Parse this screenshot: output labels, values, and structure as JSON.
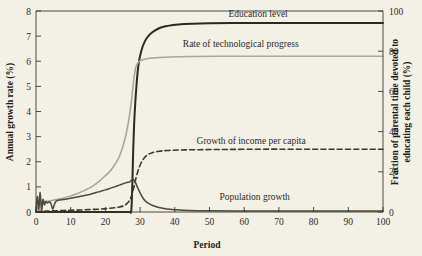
{
  "chart_data": {
    "type": "line",
    "title": "",
    "xlabel": "Period",
    "ylabel": "Annual growth rate (%)",
    "y2label": "Fraction of parental time devoted to educating each child (%)",
    "xlim": [
      0,
      100
    ],
    "ylim": [
      0,
      8
    ],
    "y2lim": [
      0,
      100
    ],
    "xticks": [
      0,
      10,
      20,
      30,
      40,
      50,
      60,
      70,
      80,
      90,
      100
    ],
    "xtick_labels": [
      "0",
      "10",
      "20",
      "30",
      "40",
      "50",
      "60",
      "70",
      "80",
      "90",
      "100"
    ],
    "yticks": [
      0,
      1,
      2,
      3,
      4,
      5,
      6,
      7,
      8
    ],
    "ytick_labels": [
      "0",
      "1",
      "2",
      "3",
      "4",
      "5",
      "6",
      "7",
      "8"
    ],
    "y2ticks": [
      0,
      20,
      40,
      60,
      80,
      100
    ],
    "y2tick_labels": [
      "0",
      "20",
      "40",
      "60",
      "80",
      "100"
    ],
    "grid": false,
    "legend_position": "inline-annotations",
    "series": [
      {
        "name": "Education level",
        "label": "Education level",
        "axis": "right",
        "color": "#2b2924",
        "style": "solid",
        "width": 2.0,
        "label_x": 64,
        "label_y_value": 97,
        "x": [
          0,
          5,
          10,
          15,
          20,
          24,
          26,
          27,
          27.4,
          27.6,
          27.8,
          28,
          28.4,
          29,
          29.6,
          30.4,
          31.4,
          32.6,
          34,
          36,
          38,
          41,
          45,
          50,
          60,
          70,
          80,
          90,
          100
        ],
        "y": [
          0,
          0,
          0,
          0,
          0,
          0,
          0,
          0,
          0,
          5,
          16,
          30,
          48,
          64,
          74,
          80.5,
          85,
          88,
          90,
          91.8,
          92.6,
          93.3,
          93.7,
          93.9,
          94,
          94,
          94,
          94,
          94
        ]
      },
      {
        "name": "Rate of technological progress",
        "label": "Rate of technological progress",
        "axis": "left",
        "color": "#a8a698",
        "style": "solid",
        "width": 1.6,
        "label_x": 59,
        "label_y_value": 6.55,
        "x": [
          0,
          0.6,
          1.2,
          2,
          3,
          4,
          5,
          6,
          8,
          10,
          12,
          14,
          16,
          18,
          20,
          21.5,
          23,
          24,
          25,
          25.8,
          26.4,
          27,
          27.4,
          27.8,
          28.2,
          28.8,
          29.6,
          30.6,
          32,
          34,
          37,
          41,
          46,
          52,
          60,
          70,
          80,
          90,
          100
        ],
        "y": [
          0.06,
          0.18,
          0.3,
          0.38,
          0.42,
          0.45,
          0.47,
          0.5,
          0.56,
          0.64,
          0.74,
          0.86,
          1.0,
          1.2,
          1.45,
          1.65,
          1.95,
          2.2,
          2.6,
          3.0,
          3.4,
          3.9,
          4.3,
          4.8,
          5.3,
          5.78,
          5.98,
          6.05,
          6.1,
          6.13,
          6.16,
          6.18,
          6.19,
          6.2,
          6.2,
          6.2,
          6.2,
          6.2,
          6.2
        ]
      },
      {
        "name": "Growth of income per capita",
        "label": "Growth of income per capita",
        "axis": "left",
        "color": "#3a3833",
        "style": "dashed",
        "width": 1.6,
        "label_x": 62,
        "label_y_value": 2.72,
        "x": [
          0,
          2,
          4,
          6,
          8,
          10,
          13,
          16,
          19,
          22,
          24,
          25.5,
          26.5,
          27.2,
          27.8,
          28.4,
          29,
          29.8,
          30.8,
          32,
          33.5,
          35.5,
          38,
          42,
          47,
          55,
          65,
          75,
          85,
          95,
          100
        ],
        "y": [
          0.02,
          0.03,
          0.04,
          0.05,
          0.06,
          0.07,
          0.08,
          0.1,
          0.12,
          0.16,
          0.2,
          0.26,
          0.38,
          0.52,
          0.78,
          1.1,
          1.45,
          1.8,
          2.08,
          2.26,
          2.36,
          2.42,
          2.45,
          2.47,
          2.48,
          2.49,
          2.5,
          2.5,
          2.5,
          2.5,
          2.5
        ]
      },
      {
        "name": "Population growth",
        "label": "Population growth",
        "axis": "left",
        "color": "#4a4840",
        "style": "solid",
        "width": 1.5,
        "label_x": 63,
        "label_y_value": 0.47,
        "x": [
          0,
          0.4,
          0.8,
          1.2,
          1.6,
          2.0,
          2.4,
          2.8,
          3.2,
          3.6,
          4.0,
          4.4,
          4.8,
          5.2,
          5.6,
          6.2,
          7,
          8,
          9,
          10,
          12,
          14,
          16,
          18,
          20,
          21.5,
          23,
          24,
          25,
          25.8,
          26.4,
          27,
          27.4,
          27.8,
          28.2,
          28.6,
          29.2,
          30,
          31,
          32.2,
          33.6,
          35.4,
          37.6,
          40,
          44,
          50,
          58,
          68,
          80,
          90,
          100
        ],
        "y": [
          0.02,
          0.62,
          0.1,
          0.78,
          0.06,
          0.5,
          0.28,
          0.42,
          0.36,
          0.38,
          0.4,
          0.3,
          0.12,
          0.26,
          0.4,
          0.46,
          0.48,
          0.5,
          0.52,
          0.55,
          0.6,
          0.66,
          0.72,
          0.8,
          0.88,
          0.95,
          1.02,
          1.07,
          1.12,
          1.16,
          1.18,
          1.2,
          1.25,
          1.3,
          1.28,
          1.2,
          1.0,
          0.76,
          0.52,
          0.36,
          0.26,
          0.18,
          0.12,
          0.09,
          0.06,
          0.05,
          0.04,
          0.04,
          0.04,
          0.04,
          0.04
        ]
      }
    ]
  },
  "colors": {
    "background": "#f3f0e6",
    "axis": "#3a3833",
    "text": "#2b2a26"
  }
}
